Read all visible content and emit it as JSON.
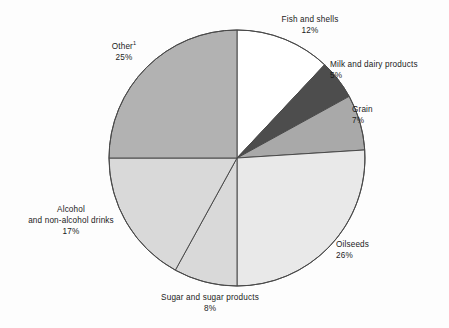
{
  "chart_data": {
    "type": "pie",
    "title": "",
    "subtitle": "",
    "xlabel": "",
    "ylabel": "",
    "legend_position": "none",
    "grid": false,
    "units": "percent",
    "total": 100,
    "start_angle_deg": 0,
    "direction": "clockwise",
    "categories": [
      "Fish and shells",
      "Milk and dairy products",
      "Grain",
      "Oilseeds",
      "Sugar and sugar products",
      "Alcohol and non-alcohol drinks",
      "Other"
    ],
    "values": [
      12,
      5,
      7,
      26,
      8,
      17,
      25
    ],
    "slices": [
      {
        "id": "fish",
        "label": "Fish and shells",
        "label_lines": [
          "Fish and shells"
        ],
        "value": 12,
        "value_label": "12%",
        "color": "#ffffff"
      },
      {
        "id": "milk",
        "label": "Milk and dairy products",
        "label_lines": [
          "Milk and dairy products"
        ],
        "value": 5,
        "value_label": "5%",
        "color": "#4d4d4d"
      },
      {
        "id": "grain",
        "label": "Grain",
        "label_lines": [
          "Grain"
        ],
        "value": 7,
        "value_label": "7%",
        "color": "#a9a9a9"
      },
      {
        "id": "oilseeds",
        "label": "Oilseeds",
        "label_lines": [
          "Oilseeds"
        ],
        "value": 26,
        "value_label": "26%",
        "color": "#e9e9e9"
      },
      {
        "id": "sugar",
        "label": "Sugar and sugar products",
        "label_lines": [
          "Sugar and sugar products"
        ],
        "value": 8,
        "value_label": "8%",
        "color": "#d9d9d9"
      },
      {
        "id": "alcohol",
        "label": "Alcohol and non-alcohol drinks",
        "label_lines": [
          "Alcohol",
          "and non-alcohol drinks"
        ],
        "value": 17,
        "value_label": "17%",
        "color": "#d9d9d9"
      },
      {
        "id": "other",
        "label": "Other",
        "label_lines": [
          "Other"
        ],
        "footnote_marker": "1",
        "value": 25,
        "value_label": "25%",
        "color": "#b2b2b2"
      }
    ]
  },
  "labels": {
    "fish": {
      "name": "Fish and shells",
      "value": "12%"
    },
    "milk": {
      "name": "Milk and dairy products",
      "value": "5%"
    },
    "grain": {
      "name": "Grain",
      "value": "7%"
    },
    "oilseeds": {
      "name": "Oilseeds",
      "value": "26%"
    },
    "sugar": {
      "name": "Sugar and sugar products",
      "value": "8%"
    },
    "alcohol": {
      "name_line1": "Alcohol",
      "name_line2": "and non-alcohol drinks",
      "value": "17%"
    },
    "other": {
      "name": "Other",
      "marker": "1",
      "value": "25%"
    }
  },
  "style": {
    "stroke": "#4a4a4a",
    "text_color": "#1b1b1b",
    "background": "#fdfdfd"
  }
}
